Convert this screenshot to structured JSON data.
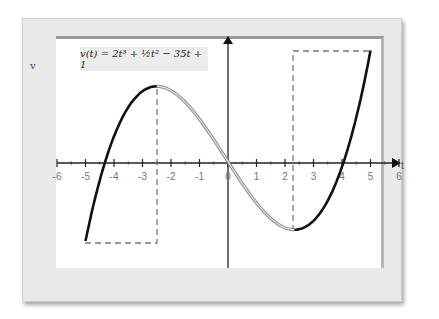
{
  "chart_data": {
    "type": "line",
    "title": "",
    "annotation": "v(t) = 2t³ + ½t² − 35t + 1",
    "xlabel": "t",
    "ylabel": "v",
    "xlim": [
      -6,
      6
    ],
    "ylim": [
      -70,
      100
    ],
    "x_ticks": [
      -6,
      -5,
      -4,
      -3,
      -2,
      -1,
      0,
      1,
      2,
      3,
      4,
      5,
      6
    ],
    "grid": false,
    "function": "2t^3 + 0.5t^2 - 35t + 1",
    "domain": [
      -5,
      5
    ],
    "series": [
      {
        "name": "v(t) increasing (left)",
        "style": "black",
        "x": [
          -5,
          -4.5,
          -4,
          -3.5,
          -3,
          -2.5
        ],
        "values": [
          -61.5,
          -23.1,
          5.0,
          23.9,
          34.5,
          60.4
        ]
      },
      {
        "name": "v(t) decreasing",
        "style": "gray-outline",
        "x": [
          -2.5,
          -2,
          -1,
          0,
          1,
          2,
          2.33
        ],
        "values": [
          60.4,
          57.0,
          34.5,
          1.0,
          -31.5,
          -52.0,
          -52.6
        ]
      },
      {
        "name": "v(t) increasing (right)",
        "style": "black",
        "x": [
          2.33,
          3,
          3.5,
          4,
          4.5,
          5
        ],
        "values": [
          -52.6,
          -46.5,
          -35.2,
          -3.0,
          19.4,
          88.5
        ]
      }
    ],
    "critical_points": [
      {
        "label": "local max",
        "t": -2.5,
        "v": 60.4
      },
      {
        "label": "local min",
        "t": 2.33,
        "v": -52.6
      }
    ],
    "dashed_guides": [
      {
        "from": [
          -5,
          -61.5
        ],
        "to": [
          -2.5,
          -61.5
        ]
      },
      {
        "from": [
          -2.5,
          -61.5
        ],
        "to": [
          -2.5,
          60.4
        ]
      },
      {
        "from": [
          2.33,
          -52.6
        ],
        "to": [
          2.33,
          88.5
        ]
      },
      {
        "from": [
          2.33,
          88.5
        ],
        "to": [
          5,
          88.5
        ]
      }
    ]
  },
  "labels": {
    "y_axis": "v",
    "x_axis": "t",
    "formula": "v(t) = 2t³ + ½t² − 35t + 1",
    "ticks": [
      "-6",
      "-5",
      "-4",
      "-3",
      "-2",
      "-1",
      "0",
      "1",
      "2",
      "3",
      "4",
      "5",
      "6"
    ]
  },
  "colors": {
    "curve_main": "#111111",
    "curve_middle": "#9a9a9a",
    "dashed": "#777777",
    "axis": "#222222",
    "frame": "#e9e9e9"
  }
}
